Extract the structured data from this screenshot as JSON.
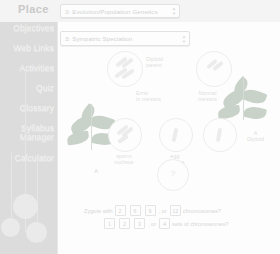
{
  "header": {
    "title": "Place"
  },
  "chapter_select": {
    "value": "3: Evolution/Population Genetics",
    "arrows_icon": "updown-arrows-icon"
  },
  "topic_select": {
    "value": "3: Sympatric Speciation",
    "arrows_icon": "updown-arrows-icon"
  },
  "sidebar": {
    "items": [
      {
        "label": "Objectives"
      },
      {
        "label": "Web Links"
      },
      {
        "label": "Activities"
      },
      {
        "label": "Quiz"
      },
      {
        "label": "Glossary"
      },
      {
        "label": "Syllabus"
      },
      {
        "label": "Manager"
      },
      {
        "label": "Calculator"
      }
    ]
  },
  "diagram": {
    "labels": {
      "diploid_parent": "Diploid\nparent",
      "error_in_meiosis": "Error\nin meiosis",
      "normal_meiosis": "Normal\nmeiosis",
      "sperm_nucleus": "sperm\nnucleus",
      "egg_nucleus": "egg\nnucleus",
      "plant_a": "A",
      "plant_a_diploid": "A\nDiploid"
    },
    "unknown_marker": "?"
  },
  "question": {
    "row1": {
      "lead": "Zygote with",
      "options": [
        "2",
        "6",
        "9",
        "12"
      ],
      "separator": ", or",
      "trail": "chromosomes?"
    },
    "row2": {
      "options": [
        "1",
        "2",
        "3",
        "4"
      ],
      "separator": ", or",
      "trail": "sets of chromosomes?"
    }
  },
  "colors": {
    "sidebar_bg": "#dcdcdc",
    "header_bg": "#f4f4f4",
    "content_bg": "#fdfdfd",
    "text_faint": "#d6d6d6",
    "plant_green": "#c8d2c8"
  }
}
